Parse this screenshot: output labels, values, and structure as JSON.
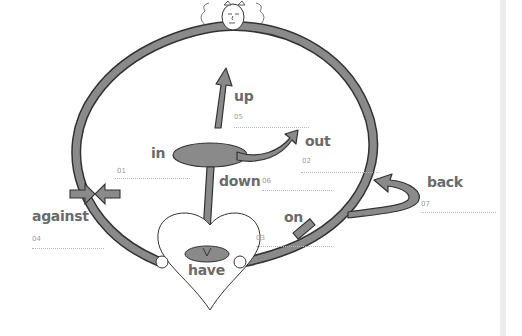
{
  "diagram": {
    "colors": {
      "ring": "#8a8a8a",
      "outline": "#333333",
      "text": "#6b6b6b",
      "number": "#9a9a9a",
      "guide_line": "#b8b8b8",
      "sidebar": "#ececec"
    },
    "items": [
      {
        "word": "in",
        "number": "01"
      },
      {
        "word": "out",
        "number": "02"
      },
      {
        "word": "on",
        "number": "03"
      },
      {
        "word": "against",
        "number": "04"
      },
      {
        "word": "up",
        "number": "05"
      },
      {
        "word": "down",
        "number": "06"
      },
      {
        "word": "back",
        "number": "07"
      },
      {
        "word": "have",
        "number": ""
      }
    ]
  }
}
